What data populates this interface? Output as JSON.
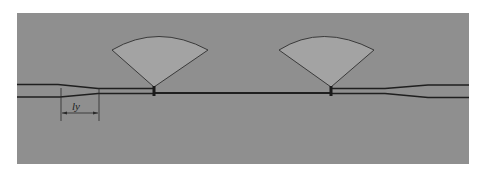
{
  "diagram": {
    "type": "microstrip-layout",
    "background_color": "#8f8f8f",
    "stub_fill_color": "#a3a3a3",
    "line_color": "#1f1f1f",
    "elements": [
      {
        "name": "left-feed-line",
        "kind": "transmission-line"
      },
      {
        "name": "left-taper",
        "kind": "taper"
      },
      {
        "name": "radial-stub-left",
        "kind": "radial-stub"
      },
      {
        "name": "center-line",
        "kind": "transmission-line"
      },
      {
        "name": "radial-stub-right",
        "kind": "radial-stub"
      },
      {
        "name": "right-taper",
        "kind": "taper"
      },
      {
        "name": "right-feed-line",
        "kind": "transmission-line"
      }
    ],
    "dimension": {
      "label": "ly",
      "description": "taper length"
    }
  }
}
